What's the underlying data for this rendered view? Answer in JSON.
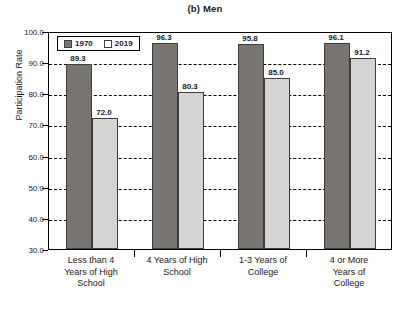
{
  "chart_data": {
    "type": "bar",
    "title": "(b) Men",
    "xlabel": "",
    "ylabel": "Participation Rate",
    "ylim": [
      30.0,
      100.0
    ],
    "ytick_step": 10.0,
    "ytick_labels": [
      "100.0",
      "90.0",
      "80.0",
      "70.0",
      "60.0",
      "50.0",
      "40.0",
      "30.0"
    ],
    "ytick_values": [
      100.0,
      90.0,
      80.0,
      70.0,
      60.0,
      50.0,
      40.0,
      30.0
    ],
    "grid": true,
    "grid_style": "dashed-horizontal",
    "legend_position": "top-left-inside",
    "categories": [
      "Less than 4 Years of High School",
      "4 Years of High School",
      "1-3 Years of College",
      "4 or More Years of College"
    ],
    "category_lines": [
      [
        "Less than 4",
        "Years of High",
        "School"
      ],
      [
        "4 Years of High",
        "School"
      ],
      [
        "1-3 Years of",
        "College"
      ],
      [
        "4 or More",
        "Years of",
        "College"
      ]
    ],
    "series": [
      {
        "name": "1970",
        "color": "#787570",
        "values": [
          89.3,
          96.3,
          95.8,
          96.1
        ],
        "labels": [
          "89.3",
          "96.3",
          "95.8",
          "96.1"
        ]
      },
      {
        "name": "2019",
        "color": "#d5d4d2",
        "values": [
          72.0,
          80.3,
          85.0,
          91.2
        ],
        "labels": [
          "72.0",
          "80.3",
          "85.0",
          "91.2"
        ]
      }
    ]
  },
  "legend": {
    "items": [
      {
        "label": "1970"
      },
      {
        "label": "2019"
      }
    ]
  },
  "source_note": ""
}
